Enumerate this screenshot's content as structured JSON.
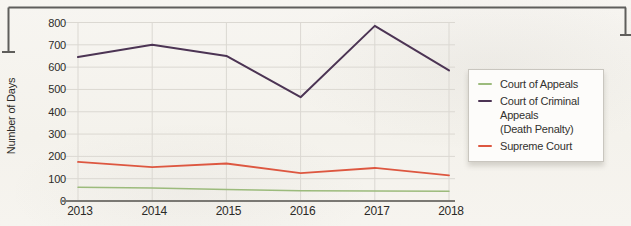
{
  "figure": {
    "y_axis_title": "Number of Days"
  },
  "legend": {
    "items": [
      {
        "name": "court-of-appeals",
        "lines": [
          "Court of Appeals"
        ],
        "color": "#9cbb7c"
      },
      {
        "name": "court-of-criminal-appeals",
        "lines": [
          "Court of Criminal Appeals",
          "(Death Penalty)"
        ],
        "color": "#4c3454"
      },
      {
        "name": "supreme-court",
        "lines": [
          "Supreme Court"
        ],
        "color": "#dd5740"
      }
    ]
  },
  "chart_data": {
    "type": "line",
    "x": [
      "2013",
      "2014",
      "2015",
      "2016",
      "2017",
      "2018"
    ],
    "series": [
      {
        "name": "Court of Appeals",
        "color": "#9cbb7c",
        "width": 1.5,
        "values": [
          62,
          58,
          52,
          46,
          45,
          44
        ]
      },
      {
        "name": "Court of Criminal Appeals (Death Penalty)",
        "color": "#4c3454",
        "width": 2,
        "values": [
          645,
          700,
          650,
          465,
          785,
          585
        ]
      },
      {
        "name": "Supreme Court",
        "color": "#dd5740",
        "width": 1.8,
        "values": [
          175,
          152,
          168,
          125,
          148,
          115
        ]
      }
    ],
    "title": "",
    "xlabel": "",
    "ylabel": "Number of Days",
    "ylim": [
      0,
      800
    ],
    "ytick_step": 100,
    "grid": true,
    "legend_position": "right"
  }
}
